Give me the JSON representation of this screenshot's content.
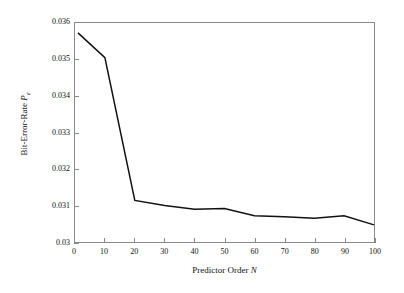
{
  "chart_data": {
    "type": "line",
    "title": "",
    "subtitle": "",
    "xlabel": "Predictor Order N",
    "xlabel_plain": "Predictor Order ",
    "xlabel_italic": "N",
    "ylabel": "Bit-Error-Rate Pe",
    "ylabel_plain": "Bit-Error-Rate ",
    "ylabel_symbol": "P",
    "ylabel_subscript": "e",
    "xlim": [
      0,
      100
    ],
    "ylim": [
      0.03,
      0.036
    ],
    "xticks": [
      0,
      10,
      20,
      30,
      40,
      50,
      60,
      70,
      80,
      90,
      100
    ],
    "xtick_labels": [
      "0",
      "10",
      "20",
      "30",
      "40",
      "50",
      "60",
      "70",
      "80",
      "90",
      "100"
    ],
    "yticks": [
      0.03,
      0.031,
      0.032,
      0.033,
      0.034,
      0.035,
      0.036
    ],
    "ytick_labels": [
      "0.03",
      "0.031",
      "0.032",
      "0.033",
      "0.034",
      "0.035",
      "0.036"
    ],
    "grid": false,
    "legend": false,
    "legend_position": "none",
    "line_color": "#111111",
    "line_width": 1.4,
    "frame_color": "#8a8a8a",
    "background_color": "#ffffff",
    "series": [
      {
        "name": "Bit-Error-Rate vs Predictor Order",
        "x": [
          1,
          10,
          20,
          30,
          40,
          50,
          60,
          70,
          80,
          90,
          100
        ],
        "values": [
          0.03573,
          0.03505,
          0.03114,
          0.031,
          0.0309,
          0.03092,
          0.03072,
          0.03069,
          0.03065,
          0.03072,
          0.03047
        ]
      }
    ]
  }
}
